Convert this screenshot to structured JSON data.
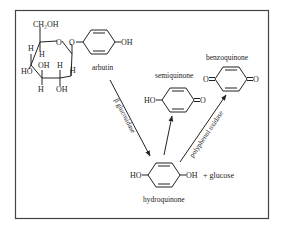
{
  "diagram": {
    "type": "chemical-reaction-pathway",
    "frame": true,
    "molecules": {
      "arbutin": {
        "name": "arbutin",
        "glucose_ring_labels": {
          "ch2oh": "CH₂OH",
          "ring_oxygen": "O",
          "glycosidic_oxygen": "O",
          "h_top_left_outer": "H",
          "h_top_left_inner": "H",
          "ho_left": "HO",
          "oh_inner": "OH",
          "h_right_inner": "H",
          "h_right_outer": "H",
          "h_bottom": "H",
          "oh_bottom": "OH"
        },
        "phenol_oh": "OH"
      },
      "semiquinone": {
        "name": "semiquinone",
        "left_group": "HO",
        "right_group": "O"
      },
      "benzoquinone": {
        "name": "benzoquinone",
        "left_group": "O",
        "right_group": "O"
      },
      "hydroquinone": {
        "name": "hydroquinone",
        "left_group": "HO",
        "right_group": "OH",
        "byproduct": "+ glucose"
      }
    },
    "enzymes": {
      "arbutin_to_hydroquinone": "β glucosidase",
      "hydroquinone_to_benzoquinone": "polyphenol oxidase"
    },
    "reactions": [
      {
        "from": "arbutin",
        "to": "hydroquinone",
        "enzyme": "β glucosidase"
      },
      {
        "from": "hydroquinone",
        "to": "semiquinone",
        "enzyme": ""
      },
      {
        "from": "hydroquinone",
        "to": "benzoquinone",
        "enzyme": "polyphenol oxidase"
      }
    ]
  }
}
